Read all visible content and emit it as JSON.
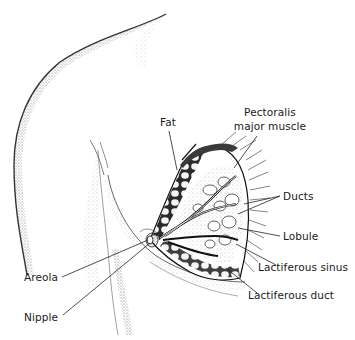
{
  "diagram": {
    "labels": {
      "fat": "Fat",
      "pectoralis_line1": "Pectoralis",
      "pectoralis_line2": "major muscle",
      "ducts": "Ducts",
      "lobule": "Lobule",
      "lactiferous_sinus": "Lactiferous sinus",
      "lactiferous_duct": "Lactiferous duct",
      "areola": "Areola",
      "nipple": "Nipple"
    },
    "colors": {
      "ink": "#1a1a1a",
      "background": "#ffffff",
      "stipple": "#555555"
    }
  }
}
